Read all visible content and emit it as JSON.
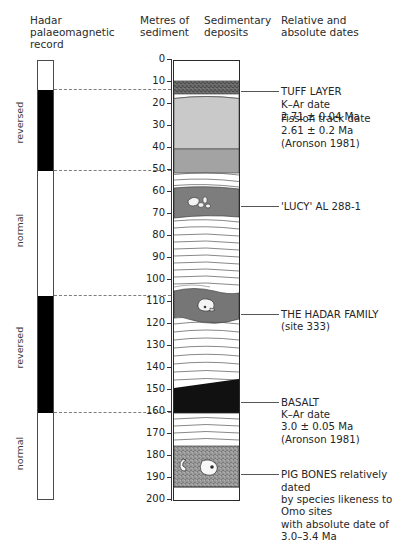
{
  "headers": {
    "magnetic": "Hadar\npalaeomagnetic\nrecord",
    "metres": "Metres of\nsediment",
    "sediment": "Sedimentary\ndeposits",
    "dates": "Relative and\nabsolute dates"
  },
  "magnetic_column": {
    "polarity_labels": [
      "reversed",
      "normal",
      "reversed",
      "normal"
    ],
    "bands": [
      {
        "polarity": "normal",
        "from_m": 0,
        "to_m": 13,
        "color": "#ffffff"
      },
      {
        "polarity": "reversed",
        "from_m": 13,
        "to_m": 50,
        "color": "#000000"
      },
      {
        "polarity": "normal",
        "from_m": 50,
        "to_m": 107,
        "color": "#ffffff"
      },
      {
        "polarity": "reversed",
        "from_m": 107,
        "to_m": 160,
        "color": "#000000"
      },
      {
        "polarity": "normal",
        "from_m": 160,
        "to_m": 200,
        "color": "#ffffff"
      }
    ],
    "correlation_depths_m": [
      13,
      50,
      107,
      160
    ]
  },
  "scale": {
    "unit": "metres",
    "min": 0,
    "max": 200,
    "step": 10,
    "ticks": [
      "0",
      "10",
      "20",
      "30",
      "40",
      "50",
      "60",
      "70",
      "80",
      "90",
      "100",
      "110",
      "120",
      "130",
      "140",
      "150",
      "160",
      "170",
      "180",
      "190",
      "200"
    ]
  },
  "annotations": [
    {
      "id": "tuff-layer",
      "depth_m": 12,
      "text": "TUFF LAYER\nK–Ar date\n2.71 ± 0.04 Ma"
    },
    {
      "id": "fission-track",
      "depth_m": 24,
      "text": "Fission track date\n2.61 ± 0.2 Ma\n(Aronson 1981)"
    },
    {
      "id": "lucy",
      "depth_m": 64,
      "text": "'LUCY' AL 288-1"
    },
    {
      "id": "hadar-family",
      "depth_m": 113,
      "text": "THE HADAR FAMILY\n(site 333)"
    },
    {
      "id": "basalt",
      "depth_m": 153,
      "text": "BASALT\nK–Ar date\n3.0 ± 0.05 Ma\n(Aronson 1981)"
    },
    {
      "id": "pig-bones",
      "depth_m": 186,
      "text": "PIG BONES relatively dated\nby species likeness to Omo sites\nwith absolute date of 3.0–3.4 Ma"
    }
  ],
  "chart_data": {
    "type": "table",
    "ylabel": "Metres of sediment",
    "ylim": [
      0,
      200
    ],
    "strata": [
      {
        "name": "upper unconformity beds",
        "from_m": 0,
        "to_m": 9,
        "fill": "white"
      },
      {
        "name": "tuff layer",
        "from_m": 9,
        "to_m": 15,
        "fill": "dark-speckle"
      },
      {
        "name": "pale band",
        "from_m": 15,
        "to_m": 17,
        "fill": "white"
      },
      {
        "name": "light grey sandstone",
        "from_m": 17,
        "to_m": 40,
        "fill": "light-grey"
      },
      {
        "name": "medium grey siltstone",
        "from_m": 40,
        "to_m": 51,
        "fill": "mid-grey"
      },
      {
        "name": "laminated silts",
        "from_m": 51,
        "to_m": 58,
        "fill": "white-lines"
      },
      {
        "name": "Lucy horizon",
        "from_m": 58,
        "to_m": 71,
        "fill": "dark-grey"
      },
      {
        "name": "laminated clays",
        "from_m": 71,
        "to_m": 104,
        "fill": "white-lines"
      },
      {
        "name": "Hadar family lens",
        "from_m": 104,
        "to_m": 120,
        "fill": "mid-grey-lens"
      },
      {
        "name": "laminated clays",
        "from_m": 120,
        "to_m": 150,
        "fill": "white-lines"
      },
      {
        "name": "basalt wedge",
        "from_m": 150,
        "to_m": 160,
        "fill": "black"
      },
      {
        "name": "laminated silts",
        "from_m": 160,
        "to_m": 177,
        "fill": "white-lines"
      },
      {
        "name": "pig bone bed",
        "from_m": 177,
        "to_m": 196,
        "fill": "speckle"
      },
      {
        "name": "basal beds",
        "from_m": 196,
        "to_m": 200,
        "fill": "white"
      }
    ],
    "fossils": [
      {
        "name": "'LUCY' AL 288-1",
        "depth_m": 64,
        "icon": "hominid-bones-icon"
      },
      {
        "name": "THE HADAR FAMILY",
        "depth_m": 113,
        "icon": "skull-icon"
      },
      {
        "name": "PIG BONES",
        "depth_m": 186,
        "icon": "pig-bones-icon"
      }
    ]
  }
}
